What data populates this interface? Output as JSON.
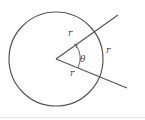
{
  "diagram": {
    "title": "",
    "labels": {
      "radius_upper": "r",
      "radius_lower": "r",
      "arc": "r",
      "angle": "θ"
    },
    "colors": {
      "stroke": "#555555",
      "label": "#444444"
    }
  }
}
